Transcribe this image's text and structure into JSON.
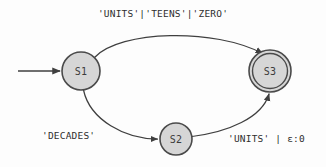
{
  "diagram": {
    "type": "finite-state-machine",
    "background_color": "#fdfdfd",
    "node_fill_color": "#d6d6d6",
    "node_stroke_color": "#4a4a4a",
    "edge_color": "#3f3f3f",
    "text_color": "#2e2e2e",
    "states": [
      {
        "id": "S1",
        "label": "S1",
        "kind": "start",
        "cx": 81,
        "cy": 71,
        "r": 19
      },
      {
        "id": "S2",
        "label": "S2",
        "kind": "normal",
        "cx": 176,
        "cy": 139,
        "r": 16
      },
      {
        "id": "S3",
        "label": "S3",
        "kind": "accepting",
        "cx": 270,
        "cy": 71,
        "r": 18,
        "r_outer": 21
      }
    ],
    "transitions": [
      {
        "id": "t1",
        "from": "S1",
        "to": "S3",
        "label": "'UNITS'|'TEENS'|'ZERO'",
        "route": "top-arc"
      },
      {
        "id": "t2",
        "from": "S1",
        "to": "S2",
        "label": "'DECADES'",
        "route": "lower-left-arc"
      },
      {
        "id": "t3",
        "from": "S2",
        "to": "S3",
        "label": "'UNITS' | ε:0",
        "route": "lower-right-arc"
      }
    ],
    "start_marker": {
      "name": "start-arrow",
      "from_x": 18,
      "to_x": 61,
      "y": 71
    }
  }
}
